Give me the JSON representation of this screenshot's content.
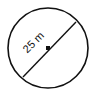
{
  "diagram": {
    "shape": "circle",
    "measurement": "diameter",
    "label": "25 m",
    "stroke_color": "#111111",
    "fill_color": "#ffffff"
  }
}
